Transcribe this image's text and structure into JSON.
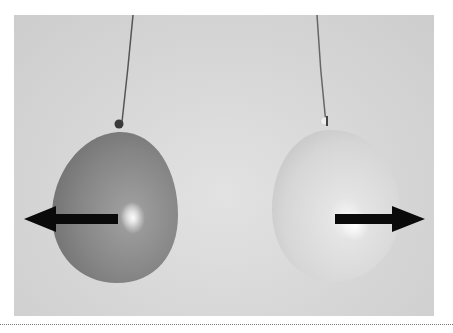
{
  "figure": {
    "left_balloon": {
      "shade": "dark",
      "color": "#8a8a8a",
      "arrow_direction": "left"
    },
    "right_balloon": {
      "shade": "light",
      "color": "#dadada",
      "arrow_direction": "right"
    },
    "arrow_color": "#0a0a0a",
    "background_color": "#d8d8d8"
  }
}
